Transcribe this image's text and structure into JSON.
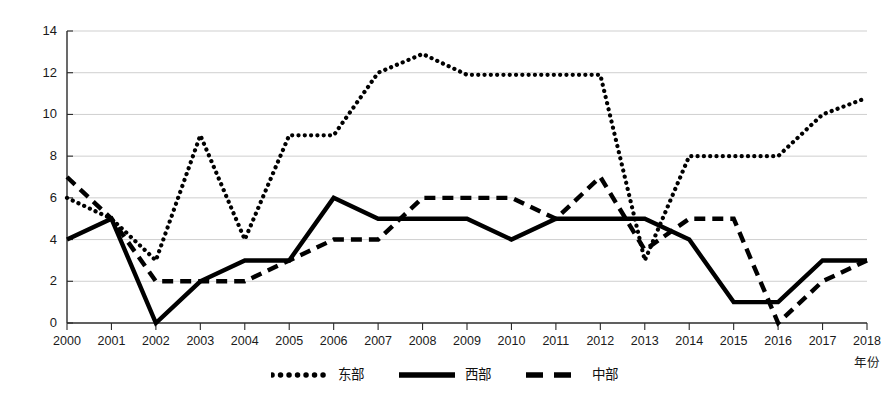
{
  "chart_data": {
    "type": "line",
    "title": "",
    "subtitle": "",
    "xlabel": "年份",
    "ylabel": "",
    "x": [
      2000,
      2001,
      2002,
      2003,
      2004,
      2005,
      2006,
      2007,
      2008,
      2009,
      2010,
      2011,
      2012,
      2013,
      2014,
      2015,
      2016,
      2017,
      2018
    ],
    "categories": [
      "2000",
      "2001",
      "2002",
      "2003",
      "2004",
      "2005",
      "2006",
      "2007",
      "2008",
      "2009",
      "2010",
      "2011",
      "2012",
      "2013",
      "2014",
      "2015",
      "2016",
      "2017",
      "2018"
    ],
    "xlim": [
      2000,
      2018
    ],
    "ylim": [
      0,
      14
    ],
    "yticks": [
      0,
      2,
      4,
      6,
      8,
      10,
      12,
      14
    ],
    "ytick_labels": [
      "0",
      "2",
      "4",
      "6",
      "8",
      "10",
      "12",
      "14"
    ],
    "grid": "horizontal",
    "legend_position": "bottom-center",
    "series": [
      {
        "name": "东部",
        "style": "dotted",
        "color": "#000000",
        "values": [
          6,
          5,
          3,
          9,
          4,
          9,
          9,
          12,
          12.9,
          11.9,
          11.9,
          11.9,
          11.9,
          3,
          8,
          8,
          8,
          10,
          10.8
        ]
      },
      {
        "name": "西部",
        "style": "solid",
        "color": "#000000",
        "values": [
          4,
          5,
          0,
          2,
          3,
          3,
          6,
          5,
          5,
          5,
          4,
          5,
          5,
          5,
          4,
          1,
          1,
          3,
          3
        ]
      },
      {
        "name": "中部",
        "style": "dashed",
        "color": "#000000",
        "values": [
          7,
          5,
          2,
          2,
          2,
          3,
          4,
          4,
          6,
          6,
          6,
          5,
          7,
          3.5,
          5,
          5,
          0,
          2,
          3
        ]
      }
    ]
  },
  "axis": {
    "x_title": "年份"
  },
  "legend": {
    "items": [
      {
        "label": "东部",
        "style": "dotted"
      },
      {
        "label": "西部",
        "style": "solid"
      },
      {
        "label": "中部",
        "style": "dashed"
      }
    ]
  }
}
